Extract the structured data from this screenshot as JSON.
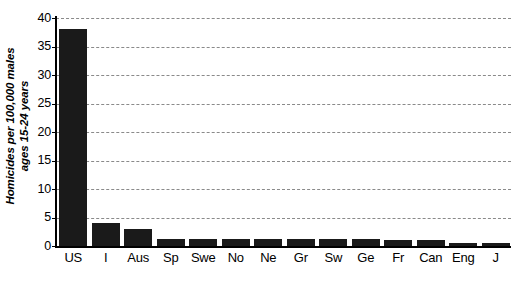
{
  "chart_data": {
    "type": "bar",
    "title": "",
    "subtitle": "",
    "xlabel": "",
    "ylabel": "Homicides per 100,000 males\nages 15-24 years",
    "categories": [
      "US",
      "I",
      "Aus",
      "Sp",
      "Swe",
      "No",
      "Ne",
      "Gr",
      "Sw",
      "Ge",
      "Fr",
      "Can",
      "Eng",
      "J"
    ],
    "values": [
      38.0,
      4.0,
      3.0,
      1.2,
      1.2,
      1.2,
      1.2,
      1.2,
      1.2,
      1.2,
      1.0,
      1.0,
      0.6,
      0.6
    ],
    "ylim": [
      0,
      40
    ],
    "yticks": [
      0,
      5,
      10,
      15,
      20,
      25,
      30,
      35,
      40
    ],
    "ytick_labels": [
      "0",
      "5",
      "10",
      "15",
      "20",
      "25",
      "30",
      "35",
      "40"
    ],
    "grid": true,
    "grid_axis": "y",
    "grid_style": "dashed",
    "legend": false,
    "legend_position": "none",
    "bar_color": "#1a1a1a",
    "grid_color": "#8a8a8a",
    "axis_color": "#000000",
    "background_color": "#ffffff"
  }
}
